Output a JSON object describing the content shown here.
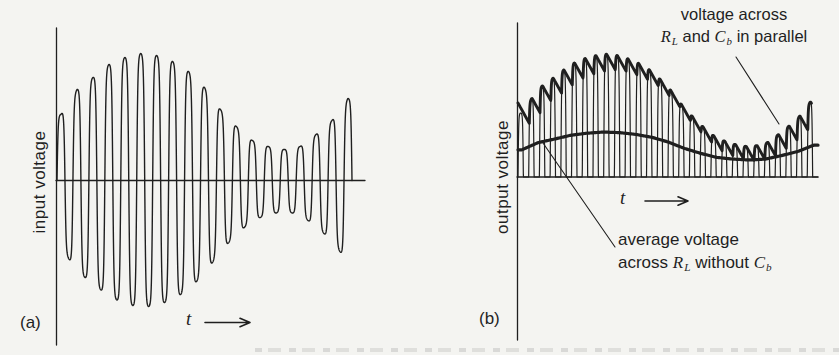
{
  "figure": {
    "colors": {
      "paper": "#f4f4f1",
      "ink": "#1f1f1f"
    }
  },
  "panel_a": {
    "tag": "(a)",
    "y_axis_label": "input voltage",
    "t_label": "t"
  },
  "panel_b": {
    "tag": "(b)",
    "y_axis_label": "output voltage",
    "t_label": "t",
    "annotations": {
      "parallel": {
        "line1": "voltage across",
        "line2": [
          "R",
          "L",
          " and ",
          "C",
          "b",
          " in parallel"
        ]
      },
      "average": {
        "line1": "average voltage",
        "line2": [
          "across ",
          "R",
          "L",
          " without ",
          "C",
          "b"
        ]
      }
    }
  },
  "waveforms": {
    "modulation_envelope": [
      [
        0.013,
        66
      ],
      [
        0.068,
        91
      ],
      [
        0.122,
        103
      ],
      [
        0.176,
        116
      ],
      [
        0.23,
        123
      ],
      [
        0.284,
        127
      ],
      [
        0.338,
        125
      ],
      [
        0.392,
        119
      ],
      [
        0.446,
        109
      ],
      [
        0.5,
        93
      ],
      [
        0.554,
        71
      ],
      [
        0.608,
        54
      ],
      [
        0.662,
        40
      ],
      [
        0.716,
        34
      ],
      [
        0.77,
        31
      ],
      [
        0.824,
        34
      ],
      [
        0.878,
        46
      ],
      [
        0.932,
        60
      ],
      [
        0.986,
        82
      ]
    ],
    "panel_a": {
      "x0": 57,
      "x1": 352,
      "zero_y": 180.5,
      "carrier_cycles": 18.5,
      "pulse_sharpness": 2.2,
      "y_axis": {
        "x": 56.5,
        "y0": 28,
        "y1": 345
      },
      "t_line": {
        "x0": 56,
        "x1": 365,
        "y": 180.5
      },
      "arrow": {
        "x0": 205,
        "x1": 250,
        "y": 322.5
      }
    },
    "panel_b": {
      "x0": 518,
      "x1": 818,
      "baseline_y": 177,
      "carrier_cycles": 28,
      "pulse_sharpness": 2.5,
      "envelope_scale": 0.97,
      "ripple_decay": 1.8,
      "ripple_start_boost": 10,
      "ripple_end_t": 0.978,
      "avg_offset": 8,
      "avg_scale": 0.3,
      "y_axis": {
        "x": 517.5,
        "y0": 23,
        "y1": 340
      },
      "t_line": {
        "x0": 517,
        "x1": 818,
        "y": 177
      },
      "arrow": {
        "x0": 645,
        "x1": 688,
        "y": 201
      },
      "pointer_parallel": {
        "x1": 736,
        "y1": 57,
        "x2": 779,
        "y2": 124
      },
      "pointer_average": {
        "x1": 543,
        "y1": 143,
        "x2": 615,
        "y2": 247
      }
    }
  }
}
